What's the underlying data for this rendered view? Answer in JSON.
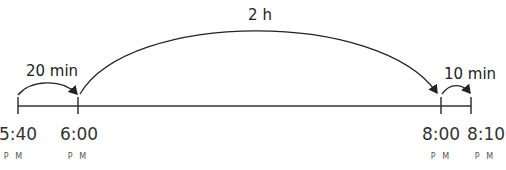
{
  "diagram": {
    "type": "number-line",
    "points": [
      {
        "time": "5:40",
        "period": "P.M.",
        "x": 18
      },
      {
        "time": "6:00",
        "period": "P.M.",
        "x": 78
      },
      {
        "time": "8:00",
        "period": "P.M.",
        "x": 441
      },
      {
        "time": "8:10",
        "period": "P.M.",
        "x": 471
      }
    ],
    "jumps": [
      {
        "label": "20 min",
        "from": "5:40",
        "to": "6:00"
      },
      {
        "label": "2 h",
        "from": "6:00",
        "to": "8:00"
      },
      {
        "label": "10 min",
        "from": "8:00",
        "to": "8:10"
      }
    ],
    "pm_display": "P M"
  }
}
